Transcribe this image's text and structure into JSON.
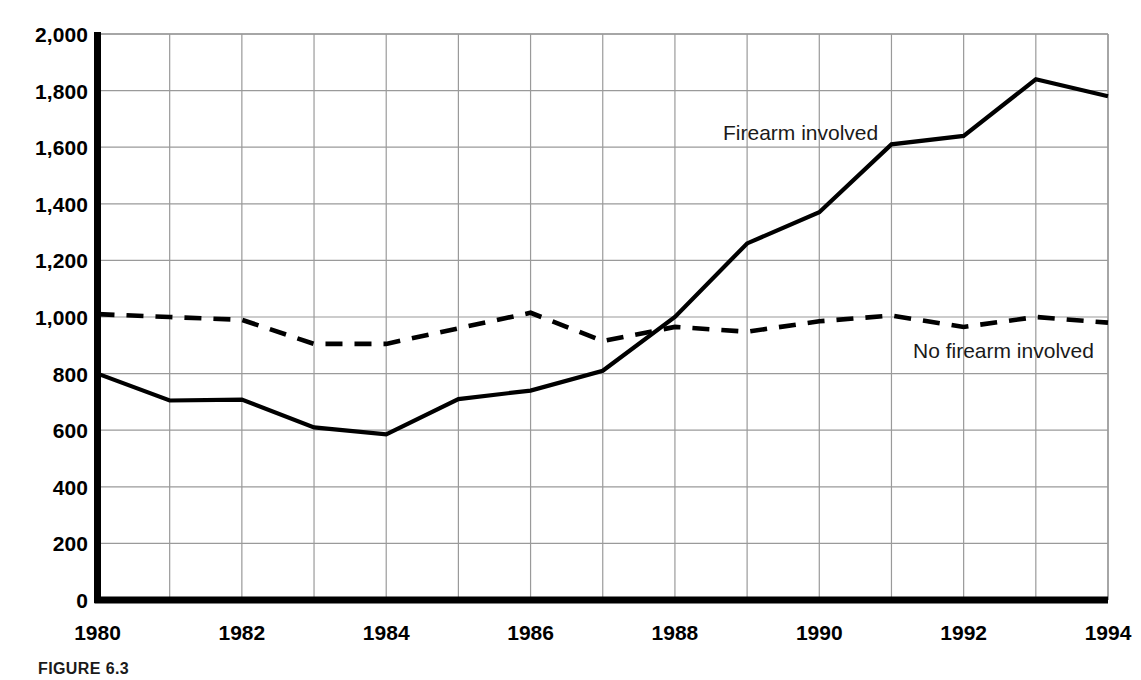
{
  "figure": {
    "caption": "FIGURE 6.3"
  },
  "annotations": {
    "firearm_label": "Firearm involved",
    "no_firearm_label": "No firearm involved"
  },
  "style": {
    "line_color": "#000000",
    "grid_color": "#9a9a9a",
    "axis_color": "#000000",
    "background": "#ffffff"
  },
  "chart_data": {
    "type": "line",
    "title": "",
    "xlabel": "",
    "ylabel": "",
    "xlim": [
      1980,
      1994
    ],
    "ylim": [
      0,
      2000
    ],
    "grid": true,
    "legend_position": "inline-annotation",
    "x": [
      1980,
      1981,
      1982,
      1983,
      1984,
      1985,
      1986,
      1987,
      1988,
      1989,
      1990,
      1991,
      1992,
      1993,
      1994
    ],
    "xtick_labels": [
      "1980",
      "1982",
      "1984",
      "1986",
      "1988",
      "1990",
      "1992",
      "1994"
    ],
    "xticks": [
      1980,
      1982,
      1984,
      1986,
      1988,
      1990,
      1992,
      1994
    ],
    "yticks": [
      0,
      200,
      400,
      600,
      800,
      1000,
      1200,
      1400,
      1600,
      1800,
      2000
    ],
    "ytick_labels": [
      "0",
      "200",
      "400",
      "600",
      "800",
      "1,000",
      "1,200",
      "1,400",
      "1,600",
      "1,800",
      "2,000"
    ],
    "series": [
      {
        "name": "Firearm involved",
        "style": "solid",
        "values": [
          800,
          705,
          708,
          610,
          585,
          710,
          740,
          810,
          1000,
          1260,
          1370,
          1610,
          1640,
          1840,
          1780
        ]
      },
      {
        "name": "No firearm involved",
        "style": "dashed",
        "values": [
          1010,
          1000,
          990,
          905,
          905,
          960,
          1015,
          915,
          965,
          948,
          985,
          1005,
          965,
          1000,
          980
        ]
      }
    ]
  }
}
